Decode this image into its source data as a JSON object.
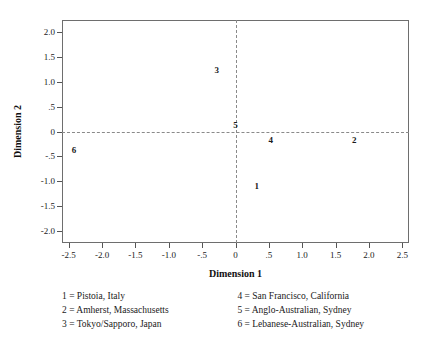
{
  "chart_data": {
    "type": "scatter",
    "title": "",
    "xlabel": "Dimension 1",
    "ylabel": "Dimension 2",
    "xlim": [
      -2.6,
      2.6
    ],
    "ylim": [
      -2.25,
      2.25
    ],
    "grid": false,
    "legend_position": "below-plot-two-columns",
    "reference_lines": [
      {
        "axis": "y",
        "value": 0,
        "style": "dashed",
        "color": "#8a8a8a"
      },
      {
        "axis": "x",
        "value": 0,
        "style": "dashed",
        "color": "#8a8a8a"
      }
    ],
    "xticks": [
      "-2.5",
      "-2.0",
      "-1.5",
      "-1.0",
      "-.5",
      "0",
      ".5",
      "1.0",
      "1.5",
      "2.0",
      "2.5"
    ],
    "xtick_values": [
      -2.5,
      -2.0,
      -1.5,
      -1.0,
      -0.5,
      0,
      0.5,
      1.0,
      1.5,
      2.0,
      2.5
    ],
    "yticks": [
      "2.0",
      "1.5",
      "1.0",
      ".5",
      "0",
      "-.5",
      "-1.0",
      "-1.5",
      "-2.0"
    ],
    "ytick_values": [
      2.0,
      1.5,
      1.0,
      0.5,
      0,
      -0.5,
      -1.0,
      -1.5,
      -2.0
    ],
    "points": [
      {
        "label": "1",
        "x": 0.32,
        "y": -1.1,
        "name": "Pistoia, Italy"
      },
      {
        "label": "2",
        "x": 1.78,
        "y": -0.17,
        "name": "Amherst, Massachusetts"
      },
      {
        "label": "3",
        "x": -0.28,
        "y": 1.25,
        "name": "Tokyo/Sapporo, Japan"
      },
      {
        "label": "4",
        "x": 0.53,
        "y": -0.17,
        "name": "San Francisco, California"
      },
      {
        "label": "5",
        "x": 0.0,
        "y": 0.13,
        "name": "Anglo-Australian, Sydney"
      },
      {
        "label": "6",
        "x": -2.42,
        "y": -0.38,
        "name": "Lebanese-Australian, Sydney"
      }
    ]
  },
  "axes": {
    "x_title": "Dimension 1",
    "y_title": "Dimension 2"
  },
  "legend": {
    "left_column": [
      "1 = Pistoia, Italy",
      "2 = Amherst, Massachusetts",
      "3 = Tokyo/Sapporo, Japan"
    ],
    "right_column": [
      "4 = San Francisco, California",
      "5 = Anglo-Australian, Sydney",
      "6 = Lebanese-Australian, Sydney"
    ]
  },
  "colors": {
    "frame": "#6e6e6e",
    "reference_line": "#8a8a8a",
    "text": "#1a1a1a",
    "background": "#ffffff"
  }
}
